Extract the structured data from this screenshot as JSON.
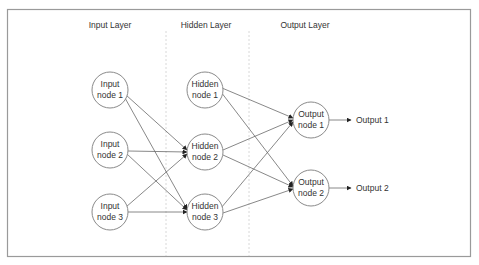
{
  "diagram": {
    "colors": {
      "background": "#ffffff",
      "frame": "#9a9a9a",
      "edge": "#6a6a6a",
      "node_stroke": "#8a8a8a",
      "text": "#333333",
      "separator": "#d8d8d8"
    },
    "layers": [
      {
        "label": "Input Layer"
      },
      {
        "label": "Hidden Layer"
      },
      {
        "label": "Output Layer"
      }
    ],
    "input_nodes": [
      {
        "line1": "Input",
        "line2": "node 1"
      },
      {
        "line1": "Input",
        "line2": "node 2"
      },
      {
        "line1": "Input",
        "line2": "node 3"
      }
    ],
    "hidden_nodes": [
      {
        "line1": "Hidden",
        "line2": "node 1"
      },
      {
        "line1": "Hidden",
        "line2": "node 2"
      },
      {
        "line1": "Hidden",
        "line2": "node 3"
      }
    ],
    "output_nodes": [
      {
        "line1": "Output",
        "line2": "node 1"
      },
      {
        "line1": "Output",
        "line2": "node 2"
      }
    ],
    "outputs": [
      {
        "label": "Output 1"
      },
      {
        "label": "Output 2"
      }
    ],
    "connections": [
      {
        "from": "Input node 1",
        "to": "Hidden node 2"
      },
      {
        "from": "Input node 1",
        "to": "Hidden node 3"
      },
      {
        "from": "Input node 2",
        "to": "Hidden node 2"
      },
      {
        "from": "Input node 2",
        "to": "Hidden node 3"
      },
      {
        "from": "Input node 3",
        "to": "Hidden node 2"
      },
      {
        "from": "Input node 3",
        "to": "Hidden node 3"
      },
      {
        "from": "Hidden node 1",
        "to": "Output node 1"
      },
      {
        "from": "Hidden node 1",
        "to": "Output node 2"
      },
      {
        "from": "Hidden node 2",
        "to": "Output node 1"
      },
      {
        "from": "Hidden node 2",
        "to": "Output node 2"
      },
      {
        "from": "Hidden node 3",
        "to": "Output node 1"
      },
      {
        "from": "Hidden node 3",
        "to": "Output node 2"
      },
      {
        "from": "Output node 1",
        "to": "Output 1"
      },
      {
        "from": "Output node 2",
        "to": "Output 2"
      }
    ]
  }
}
